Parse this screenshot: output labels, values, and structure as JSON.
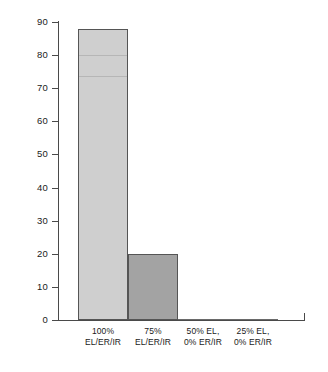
{
  "chart_data": {
    "type": "bar",
    "title": "",
    "subtitle": "",
    "xlabel": "",
    "ylabel": "",
    "categories": [
      "100% EL/ER/IR",
      "75% EL/ER/IR",
      "50% EL, 0% ER/IR",
      "25% EL, 0% ER/IR"
    ],
    "category_lines": [
      [
        "100%",
        "EL/ER/IR"
      ],
      [
        "75%",
        "EL/ER/IR"
      ],
      [
        "50% EL,",
        "0% ER/IR"
      ],
      [
        "25% EL,",
        "0% ER/IR"
      ]
    ],
    "values": [
      88,
      20,
      0,
      0
    ],
    "bar_colors": [
      "#cfcfcf",
      "#a3a3a3",
      "#cfcfcf",
      "#cfcfcf"
    ],
    "ylim": [
      0,
      90
    ],
    "yticks": [
      0,
      10,
      20,
      30,
      40,
      50,
      60,
      70,
      80,
      90
    ],
    "ytick_labels": [
      "0",
      "10",
      "20",
      "30",
      "40",
      "50",
      "60",
      "70",
      "80",
      "90"
    ],
    "grid": false,
    "legend": false,
    "legend_position": "none",
    "annotations": []
  },
  "style": {
    "background": "#ffffff",
    "axis_color": "#4a4a4a",
    "text_color": "#1a1a1a",
    "bar_outline": "#555555"
  }
}
